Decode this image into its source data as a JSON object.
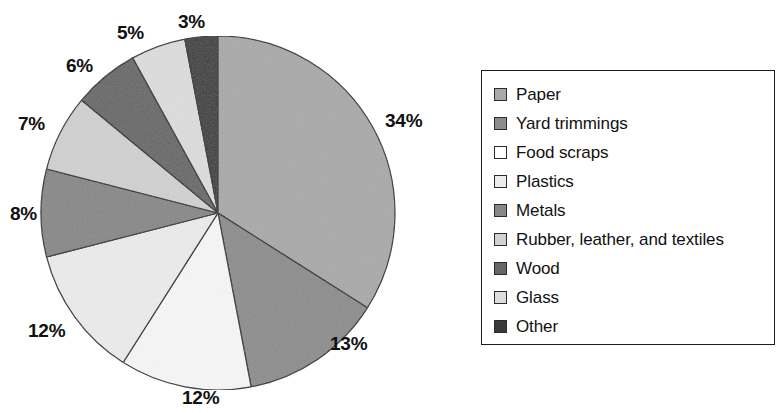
{
  "chart_data": {
    "type": "pie",
    "title": "",
    "subtitle": "",
    "xlabel": "",
    "ylabel": "",
    "legend_position": "right",
    "grid": false,
    "units": "percent",
    "start_angle_deg": 0,
    "direction": "clockwise",
    "categories": [
      "Paper",
      "Yard trimmings",
      "Food scraps",
      "Plastics",
      "Metals",
      "Rubber, leather, and textiles",
      "Wood",
      "Glass",
      "Other"
    ],
    "values": [
      34,
      13,
      12,
      12,
      8,
      7,
      6,
      5,
      3
    ],
    "data_labels": [
      "34%",
      "13%",
      "12%",
      "12%",
      "8%",
      "7%",
      "6%",
      "5%",
      "3%"
    ],
    "slice_colors": [
      "#a9a9a9",
      "#8c8c8c",
      "#f7f7f7",
      "#ececec",
      "#878787",
      "#d1d1d1",
      "#666666",
      "#dddddd",
      "#3a3a3a"
    ],
    "slices": [
      {
        "label": "Paper",
        "value": 34,
        "data_label": "34%",
        "color": "#a9a9a9"
      },
      {
        "label": "Yard trimmings",
        "value": 13,
        "data_label": "13%",
        "color": "#8c8c8c"
      },
      {
        "label": "Food scraps",
        "value": 12,
        "data_label": "12%",
        "color": "#f7f7f7"
      },
      {
        "label": "Plastics",
        "value": 12,
        "data_label": "12%",
        "color": "#ececec"
      },
      {
        "label": "Metals",
        "value": 8,
        "data_label": "8%",
        "color": "#878787"
      },
      {
        "label": "Rubber, leather, and textiles",
        "value": 7,
        "data_label": "7%",
        "color": "#d1d1d1"
      },
      {
        "label": "Wood",
        "value": 6,
        "data_label": "6%",
        "color": "#666666"
      },
      {
        "label": "Glass",
        "value": 5,
        "data_label": "5%",
        "color": "#dddddd"
      },
      {
        "label": "Other",
        "value": 3,
        "data_label": "3%",
        "color": "#3a3a3a"
      }
    ]
  },
  "pie": {
    "center_x": 218,
    "center_y": 213,
    "radius": 177,
    "outline_color": "#2b2b2b",
    "labels": [
      {
        "text": "34%",
        "x": 385,
        "y": 110
      },
      {
        "text": "13%",
        "x": 330,
        "y": 333
      },
      {
        "text": "12%",
        "x": 182,
        "y": 387
      },
      {
        "text": "12%",
        "x": 28,
        "y": 320
      },
      {
        "text": "8%",
        "x": 10,
        "y": 203
      },
      {
        "text": "7%",
        "x": 18,
        "y": 113
      },
      {
        "text": "6%",
        "x": 66,
        "y": 55
      },
      {
        "text": "5%",
        "x": 117,
        "y": 22
      },
      {
        "text": "3%",
        "x": 178,
        "y": 11
      }
    ]
  },
  "legend": {
    "items": [
      {
        "label": "Paper",
        "color": "#a9a9a9"
      },
      {
        "label": "Yard trimmings",
        "color": "#8c8c8c"
      },
      {
        "label": "Food scraps",
        "color": "#ffffff"
      },
      {
        "label": "Plastics",
        "color": "#ececec"
      },
      {
        "label": "Metals",
        "color": "#878787"
      },
      {
        "label": "Rubber, leather, and textiles",
        "color": "#d1d1d1"
      },
      {
        "label": "Wood",
        "color": "#666666"
      },
      {
        "label": "Glass",
        "color": "#dddddd"
      },
      {
        "label": "Other",
        "color": "#3a3a3a"
      }
    ]
  }
}
